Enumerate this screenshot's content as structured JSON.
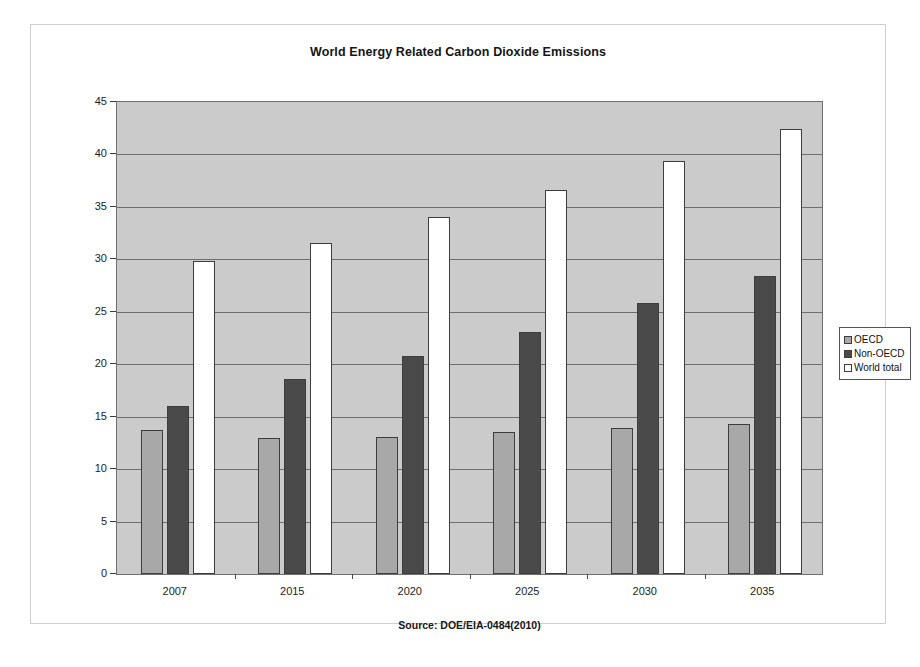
{
  "chart_data": {
    "type": "bar",
    "title": "World Energy Related Carbon Dioxide Emissions",
    "xlabel": "",
    "ylabel": "Billion Metric Tons",
    "categories": [
      "2007",
      "2015",
      "2020",
      "2025",
      "2030",
      "2035"
    ],
    "series": [
      {
        "name": "OECD",
        "color": "#a8a8a8",
        "values": [
          13.7,
          13.0,
          13.1,
          13.5,
          13.9,
          14.3
        ]
      },
      {
        "name": "Non-OECD",
        "color": "#4a4a4a",
        "values": [
          16.0,
          18.6,
          20.8,
          23.1,
          25.8,
          28.4
        ]
      },
      {
        "name": "World total",
        "color": "#ffffff",
        "values": [
          29.8,
          31.6,
          34.0,
          36.6,
          39.4,
          42.4
        ]
      }
    ],
    "ylim": [
      0,
      45
    ],
    "yticks": [
      0,
      5,
      10,
      15,
      20,
      25,
      30,
      35,
      40,
      45
    ],
    "grid": true,
    "legend_position": "right",
    "plot_background": "#cbcbcb",
    "source_note": "Source: DOE/EIA-0484(2010)"
  },
  "legend": {
    "items": [
      {
        "label": "OECD"
      },
      {
        "label": "Non-OECD"
      },
      {
        "label": "World total"
      }
    ]
  }
}
